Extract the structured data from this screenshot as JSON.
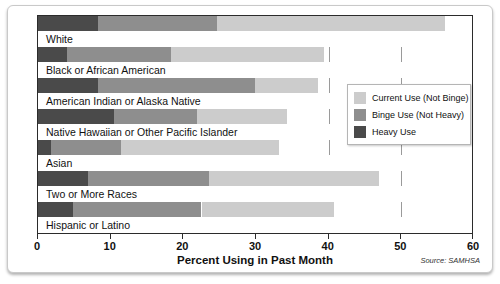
{
  "chart_data": {
    "type": "bar",
    "orientation": "horizontal",
    "stacked": true,
    "title": "",
    "xlabel": "Percent Using in Past Month",
    "ylabel": "",
    "xlim": [
      0,
      60
    ],
    "xticks": [
      0,
      10,
      20,
      30,
      40,
      50,
      60
    ],
    "xtick_labels": [
      "0",
      "10",
      "20",
      "30",
      "40",
      "50",
      "60"
    ],
    "grid": true,
    "grid_axis": "x",
    "legend_position": "middle-right",
    "source": "Source: SAMHSA",
    "categories": [
      "White",
      "Black or African American",
      "American Indian or Alaska Native",
      "Native Hawaiian or Other Pacific Islander",
      "Asian",
      "Two or More Races",
      "Hispanic or Latino"
    ],
    "series": [
      {
        "name": "Heavy Use",
        "color": "#4a4a4a",
        "values": [
          8.3,
          4.0,
          8.3,
          10.4,
          1.8,
          6.9,
          4.8
        ]
      },
      {
        "name": "Binge Use (Not Heavy)",
        "color": "#8e8e8e",
        "values": [
          16.3,
          14.3,
          21.5,
          11.5,
          9.6,
          16.7,
          17.7
        ]
      },
      {
        "name": "Current Use (Not Binge)",
        "color": "#cccccc",
        "values": [
          31.4,
          21.0,
          8.7,
          12.4,
          21.7,
          23.3,
          18.2
        ]
      }
    ],
    "totals": [
      56.0,
      39.3,
      38.5,
      34.3,
      33.1,
      46.9,
      40.7
    ]
  },
  "legend": {
    "items": [
      {
        "label": "Current Use (Not Binge)",
        "color": "#cccccc"
      },
      {
        "label": "Binge Use (Not Heavy)",
        "color": "#8e8e8e"
      },
      {
        "label": "Heavy Use",
        "color": "#4a4a4a"
      }
    ]
  }
}
